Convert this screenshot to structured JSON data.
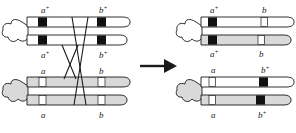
{
  "figure": {
    "arrow": {
      "name": "transition-arrow",
      "direction": "right"
    },
    "colors": {
      "outline": "#1a1a1a",
      "dominant_band": "#111111",
      "recessive_band": "#ffffff",
      "paternal_fill": "#ffffff",
      "maternal_fill": "#d9d9d9",
      "background": "#ffffff",
      "crossover_line": "#1a1a1a"
    }
  },
  "left_panel": {
    "name": "before-crossover",
    "chromosomes": [
      {
        "id": "paternal",
        "fill": "paternal_fill",
        "chromatids": [
          {
            "id": "paternal-chromatid-1",
            "bands": [
              "a+",
              "b+"
            ]
          },
          {
            "id": "paternal-chromatid-2",
            "bands": [
              "a+",
              "b+"
            ]
          }
        ]
      },
      {
        "id": "maternal",
        "fill": "maternal_fill",
        "chromatids": [
          {
            "id": "maternal-chromatid-1",
            "bands": [
              "a",
              "b"
            ]
          },
          {
            "id": "maternal-chromatid-2",
            "bands": [
              "a",
              "b"
            ]
          }
        ]
      }
    ],
    "labels": {
      "top_a": "a",
      "top_a_sup": "+",
      "top_b": "b",
      "top_b_sup": "+",
      "mid_upper_a": "a",
      "mid_upper_a_sup": "+",
      "mid_upper_b": "b",
      "mid_upper_b_sup": "+",
      "mid_lower_a": "a",
      "mid_lower_b": "b",
      "bottom_a": "a",
      "bottom_b": "b"
    }
  },
  "right_panel": {
    "name": "after-crossover",
    "chromosomes": [
      {
        "id": "recombinant-upper",
        "chromatids": [
          {
            "id": "recombinant-upper-chromatid-1",
            "fill": "paternal_fill",
            "bands": [
              "a+",
              "b"
            ]
          },
          {
            "id": "recombinant-upper-chromatid-2",
            "fill": "maternal_fill",
            "bands": [
              "a+",
              "b"
            ]
          }
        ]
      },
      {
        "id": "recombinant-lower",
        "chromatids": [
          {
            "id": "recombinant-lower-chromatid-1",
            "fill": "paternal_fill",
            "bands": [
              "a",
              "b+"
            ]
          },
          {
            "id": "recombinant-lower-chromatid-2",
            "fill": "maternal_fill",
            "bands": [
              "a",
              "b+"
            ]
          }
        ]
      }
    ],
    "labels": {
      "top_a": "a",
      "top_a_sup": "+",
      "top_b": "b",
      "mid_a": "a",
      "mid_a_sup": "+",
      "mid_b": "b",
      "lower_a": "a",
      "lower_b": "b",
      "lower_b_sup": "+",
      "bottom_a": "a",
      "bottom_b": "b",
      "bottom_b_sup": "+"
    }
  }
}
